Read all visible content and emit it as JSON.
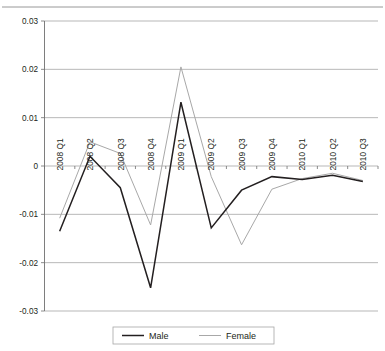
{
  "chart_data": {
    "type": "line",
    "title": "",
    "subtitle": "",
    "xlabel": "",
    "ylabel": "",
    "grid": true,
    "legend_position": "bottom",
    "categories": [
      "2008 Q1",
      "2008 Q2",
      "2008 Q3",
      "2008 Q4",
      "2009 Q1",
      "2009 Q2",
      "2009 Q3",
      "2009 Q4",
      "2010 Q1",
      "2010 Q2",
      "2010 Q3"
    ],
    "ylim": [
      -0.03,
      0.03
    ],
    "yticks": [
      0.03,
      0.02,
      0.01,
      0,
      -0.01,
      -0.02,
      -0.03
    ],
    "ytick_labels": [
      "0.03",
      "0.02",
      "0.01",
      "0",
      "-0.01",
      "-0.02",
      "-0.03"
    ],
    "series": [
      {
        "name": "Male",
        "color": "#231f20",
        "values": [
          -0.0135,
          0.002,
          -0.0045,
          -0.0252,
          0.0132,
          -0.0128,
          -0.005,
          -0.0022,
          -0.0028,
          -0.0019,
          -0.0032
        ]
      },
      {
        "name": "Female",
        "color": "#a8a8a8",
        "values": [
          -0.0108,
          0.005,
          0.0026,
          -0.0122,
          0.0205,
          -0.0022,
          -0.0163,
          -0.0048,
          -0.0026,
          -0.0015,
          -0.003
        ]
      }
    ]
  },
  "legend": {
    "items": [
      {
        "label": "Male"
      },
      {
        "label": "Female"
      }
    ]
  }
}
